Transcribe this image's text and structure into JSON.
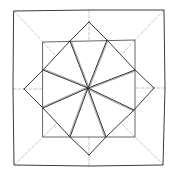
{
  "diagram": {
    "type": "crease-pattern-star",
    "width": 174,
    "height": 178,
    "colors": {
      "background": "#ffffff",
      "outline": "#3a3a3a",
      "inner_square": "#555555",
      "petal": "#2e2e2e",
      "petal_double": "#8a8a8a",
      "dashed": "#b8b8b8"
    },
    "outer_square": [
      [
        14,
        11
      ],
      [
        90,
        10
      ],
      [
        164,
        10
      ],
      [
        165,
        88
      ],
      [
        163,
        165
      ],
      [
        90,
        166
      ],
      [
        14,
        165
      ],
      [
        13,
        88
      ]
    ],
    "inner_square": [
      [
        43,
        42
      ],
      [
        135,
        40
      ],
      [
        135,
        137
      ],
      [
        43,
        137
      ]
    ],
    "center": [
      88,
      88
    ],
    "diamond_tips": {
      "top": [
        89,
        22
      ],
      "right": [
        154,
        88
      ],
      "bottom": [
        89,
        155
      ],
      "left": [
        24,
        89
      ]
    },
    "star_points": [
      [
        70,
        41
      ],
      [
        107,
        40
      ],
      [
        135,
        70
      ],
      [
        134,
        110
      ],
      [
        106,
        137
      ],
      [
        70,
        137
      ],
      [
        43,
        108
      ],
      [
        43,
        70
      ]
    ],
    "dashed_lines": [
      [
        [
          14,
          11
        ],
        [
          43,
          42
        ]
      ],
      [
        [
          164,
          10
        ],
        [
          135,
          40
        ]
      ],
      [
        [
          164,
          165
        ],
        [
          135,
          137
        ]
      ],
      [
        [
          14,
          165
        ],
        [
          43,
          137
        ]
      ],
      [
        [
          43,
          42
        ],
        [
          55,
          55
        ]
      ],
      [
        [
          135,
          40
        ],
        [
          123,
          53
        ]
      ],
      [
        [
          135,
          137
        ],
        [
          122,
          124
        ]
      ],
      [
        [
          43,
          137
        ],
        [
          56,
          124
        ]
      ],
      [
        [
          89,
          10
        ],
        [
          89,
          22
        ]
      ],
      [
        [
          89,
          22
        ],
        [
          89,
          40
        ]
      ],
      [
        [
          165,
          88
        ],
        [
          154,
          88
        ]
      ],
      [
        [
          154,
          88
        ],
        [
          135,
          88
        ]
      ],
      [
        [
          89,
          166
        ],
        [
          89,
          155
        ]
      ],
      [
        [
          89,
          155
        ],
        [
          89,
          137
        ]
      ],
      [
        [
          13,
          89
        ],
        [
          24,
          89
        ]
      ],
      [
        [
          24,
          89
        ],
        [
          43,
          89
        ]
      ]
    ]
  }
}
